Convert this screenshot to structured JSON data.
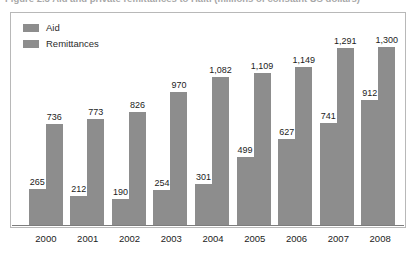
{
  "caption": {
    "text": "Figure 2.3  Aid and private remittances to Haiti (millions of constant US dollars)"
  },
  "chart_data": {
    "type": "bar",
    "title": "",
    "xlabel": "",
    "ylabel": "",
    "ylim": [
      0,
      1400
    ],
    "grid": false,
    "legend_position": "top-left",
    "categories": [
      "2000",
      "2001",
      "2002",
      "2003",
      "2004",
      "2005",
      "2006",
      "2007",
      "2008"
    ],
    "series": [
      {
        "name": "Aid",
        "color": "#8d8d8d",
        "values": [
          265,
          212,
          190,
          254,
          301,
          499,
          627,
          741,
          912
        ],
        "labels": [
          "265",
          "212",
          "190",
          "254",
          "301",
          "499",
          "627",
          "741",
          "912"
        ]
      },
      {
        "name": "Remittances",
        "color": "#8d8d8d",
        "values": [
          736,
          773,
          826,
          970,
          1082,
          1109,
          1149,
          1291,
          1300
        ],
        "labels": [
          "736",
          "773",
          "826",
          "970",
          "1,082",
          "1,109",
          "1,149",
          "1,291",
          "1,300"
        ]
      }
    ]
  },
  "legend": {
    "items": [
      {
        "label": "Aid",
        "color": "#8d8d8d"
      },
      {
        "label": "Remittances",
        "color": "#8d8d8d"
      }
    ]
  }
}
